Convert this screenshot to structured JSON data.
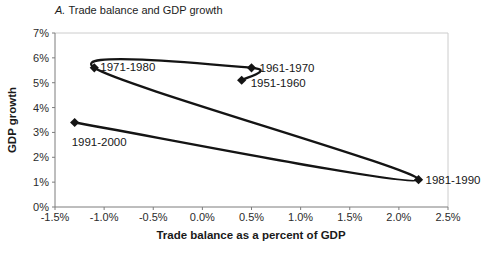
{
  "title": {
    "prefix": "A.",
    "rest": "Trade balance and GDP growth"
  },
  "chart_data": {
    "type": "scatter",
    "line_style": "smooth",
    "xlabel": "Trade balance as a percent of GDP",
    "ylabel": "GDP growth",
    "xlim": [
      -1.5,
      2.5
    ],
    "ylim": [
      0,
      7
    ],
    "grid": "off",
    "legend": "none",
    "colors": {
      "line": "#141414",
      "marker": "#141414",
      "axis": "#7d7d7d",
      "plot_frame": "#cccccc",
      "background": "#ffffff"
    },
    "x_ticks": [
      {
        "v": -1.5,
        "label": "-1.5%"
      },
      {
        "v": -1.0,
        "label": "-1.0%"
      },
      {
        "v": -0.5,
        "label": "-0.5%"
      },
      {
        "v": 0.0,
        "label": "0.0%"
      },
      {
        "v": 0.5,
        "label": "0.5%"
      },
      {
        "v": 1.0,
        "label": "1.0%"
      },
      {
        "v": 1.5,
        "label": "1.5%"
      },
      {
        "v": 2.0,
        "label": "2.0%"
      },
      {
        "v": 2.5,
        "label": "2.5%"
      }
    ],
    "y_ticks": [
      {
        "v": 0,
        "label": "0%"
      },
      {
        "v": 1,
        "label": "1%"
      },
      {
        "v": 2,
        "label": "2%"
      },
      {
        "v": 3,
        "label": "3%"
      },
      {
        "v": 4,
        "label": "4%"
      },
      {
        "v": 5,
        "label": "5%"
      },
      {
        "v": 6,
        "label": "6%"
      },
      {
        "v": 7,
        "label": "7%"
      }
    ],
    "points": [
      {
        "label": "1951-1960",
        "x": 0.4,
        "y": 5.1,
        "label_offset": [
          9,
          7
        ]
      },
      {
        "label": "1961-1970",
        "x": 0.5,
        "y": 5.6,
        "label_offset": [
          8,
          4
        ]
      },
      {
        "label": "1971-1980",
        "x": -1.1,
        "y": 5.6,
        "label_offset": [
          6,
          3
        ]
      },
      {
        "label": "1981-1990",
        "x": 2.2,
        "y": 1.1,
        "label_offset": [
          7,
          4
        ]
      },
      {
        "label": "1991-2000",
        "x": -1.3,
        "y": 3.4,
        "label_offset": [
          -3,
          24
        ]
      }
    ]
  }
}
